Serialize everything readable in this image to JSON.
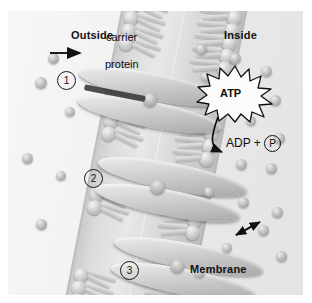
{
  "diagram": {
    "title_labels": {
      "outside": "Outside",
      "inside": "Inside",
      "membrane": "Membrane"
    },
    "protein_labels": {
      "carrier": "carrier",
      "protein": "protein"
    },
    "energy": {
      "atp": "ATP",
      "products": "ADP + ",
      "phosphate": "P"
    },
    "steps": [
      {
        "number": "1"
      },
      {
        "number": "2"
      },
      {
        "number": "3"
      }
    ],
    "icons": {
      "inbound_arrow": "arrow-right-icon",
      "outbound_arrow": "arrow-up-right-icon",
      "hydrolysis_arrow": "curved-arrow-icon",
      "starburst": "starburst-icon"
    },
    "colors": {
      "plate_background": "#f2f2f2",
      "outside_background": "#f7f7f7",
      "inside_background": "#e6e6e6",
      "membrane": "#dcdcdc",
      "molecule": "#c2c2c2",
      "ink": "#111111"
    }
  }
}
